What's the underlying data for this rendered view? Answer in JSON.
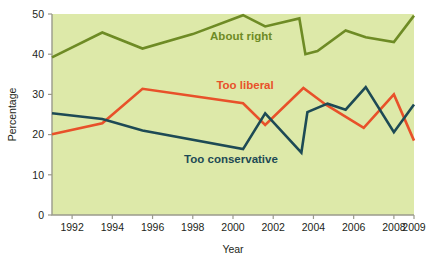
{
  "chart_data": {
    "type": "line",
    "title": "",
    "xlabel": "Year",
    "ylabel": "Percentage",
    "xlim": [
      1991,
      2009
    ],
    "ylim": [
      0,
      50
    ],
    "ytick_values": [
      0,
      10,
      20,
      30,
      40,
      50
    ],
    "ytick_labels": [
      "0",
      "10",
      "20",
      "30",
      "40",
      "50"
    ],
    "xtick_values": [
      1992,
      1994,
      1996,
      1998,
      2000,
      2002,
      2004,
      2006,
      2008,
      2009
    ],
    "xtick_labels": [
      "1992",
      "1994",
      "1996",
      "1998",
      "2000",
      "2002",
      "2004",
      "2006",
      "2008",
      "2009"
    ],
    "grid": false,
    "legend_position": "inline-annotations",
    "plot_background": "#dde9a9",
    "series": [
      {
        "name": "About right",
        "color": "#6e8b25",
        "label_x": 2000.4,
        "label_y": 43.6,
        "x": [
          1991.0,
          1993.5,
          1995.5,
          1998.0,
          2000.5,
          2001.6,
          2003.3,
          2003.6,
          2004.2,
          2005.6,
          2006.6,
          2008.0,
          2009.0
        ],
        "values": [
          39.2,
          45.4,
          41.4,
          45.0,
          49.7,
          46.9,
          48.9,
          40.0,
          40.8,
          45.9,
          44.2,
          43.0,
          49.6
        ]
      },
      {
        "name": "Too liberal",
        "color": "#e8512a",
        "label_x": 2000.6,
        "label_y": 31.4,
        "x": [
          1991.0,
          1993.5,
          1995.5,
          2000.5,
          2001.6,
          2003.5,
          2004.6,
          2006.5,
          2008.0,
          2009.0
        ],
        "values": [
          20.1,
          22.8,
          31.4,
          27.8,
          22.4,
          31.6,
          27.5,
          21.7,
          30.0,
          18.5
        ]
      },
      {
        "name": "Too conservative",
        "color": "#1d4a55",
        "label_x": 1999.9,
        "label_y": 13.0,
        "x": [
          1991.0,
          1993.5,
          1995.5,
          2000.5,
          2001.6,
          2003.4,
          2003.7,
          2004.7,
          2005.6,
          2006.6,
          2008.0,
          2009.0
        ],
        "values": [
          25.3,
          23.9,
          21.0,
          16.4,
          25.3,
          15.5,
          25.6,
          27.7,
          26.2,
          31.8,
          20.6,
          27.5
        ]
      }
    ]
  },
  "geometry": {
    "plot_left": 52,
    "plot_right": 414,
    "plot_top": 14,
    "plot_bottom": 215
  }
}
